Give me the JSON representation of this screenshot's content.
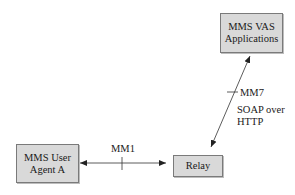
{
  "diagram": {
    "nodes": [
      {
        "id": "vas",
        "line1": "MMS VAS",
        "line2": "Applications"
      },
      {
        "id": "ua",
        "line1": "MMS User",
        "line2": "Agent A"
      },
      {
        "id": "relay",
        "line1": "Relay"
      }
    ],
    "edges": [
      {
        "id": "mm1",
        "from": "ua",
        "to": "relay",
        "label": "MM1",
        "bidirectional": true
      },
      {
        "id": "mm7",
        "from": "relay",
        "to": "vas",
        "label": "MM7",
        "protocol_line1": "SOAP over",
        "protocol_line2": "HTTP",
        "bidirectional": true
      }
    ],
    "colors": {
      "node_fill": "#d9d9d9",
      "node_border": "#7a7a7a",
      "line": "#222222"
    }
  }
}
